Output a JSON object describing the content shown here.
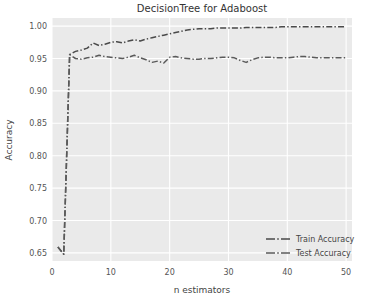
{
  "chart_data": {
    "type": "line",
    "title": "DecisionTree for Adaboost",
    "xlabel": "n estimators",
    "ylabel": "Accuracy",
    "xlim": [
      0,
      51
    ],
    "ylim": [
      0.6375,
      1.0125
    ],
    "xticks": [
      0,
      10,
      20,
      30,
      40,
      50
    ],
    "xticklabels": [
      "0",
      "10",
      "20",
      "30",
      "40",
      "50"
    ],
    "yticks": [
      0.65,
      0.7,
      0.75,
      0.8,
      0.85,
      0.9,
      0.95,
      1.0
    ],
    "yticklabels": [
      "0.65",
      "0.70",
      "0.75",
      "0.80",
      "0.85",
      "0.90",
      "0.95",
      "1.00"
    ],
    "grid": true,
    "grid_color": "#ffffff",
    "plot_bg": "#eaeaea",
    "figure_bg": "#ffffff",
    "legend_position": "lower right",
    "x": [
      1,
      2,
      3,
      4,
      5,
      6,
      7,
      8,
      9,
      10,
      11,
      12,
      13,
      14,
      15,
      16,
      17,
      18,
      19,
      20,
      21,
      22,
      23,
      24,
      25,
      26,
      27,
      28,
      29,
      30,
      31,
      32,
      33,
      34,
      35,
      36,
      37,
      38,
      39,
      40,
      41,
      42,
      43,
      44,
      45,
      46,
      47,
      48,
      49,
      50
    ],
    "series": [
      {
        "name": "Train Accuracy",
        "color": "#4a4a4a",
        "linestyle": "dashdot",
        "values": [
          0.659,
          0.648,
          0.956,
          0.961,
          0.963,
          0.966,
          0.974,
          0.97,
          0.972,
          0.975,
          0.976,
          0.974,
          0.977,
          0.979,
          0.977,
          0.98,
          0.982,
          0.984,
          0.986,
          0.988,
          0.99,
          0.992,
          0.994,
          0.995,
          0.996,
          0.996,
          0.996,
          0.997,
          0.997,
          0.997,
          0.997,
          0.997,
          0.998,
          0.998,
          0.998,
          0.998,
          0.998,
          0.998,
          0.999,
          0.999,
          0.999,
          0.999,
          0.999,
          0.999,
          0.999,
          0.999,
          0.999,
          0.999,
          0.999,
          0.999
        ]
      },
      {
        "name": "Test Accuracy",
        "color": "#5a5a5a",
        "linestyle": "dashdot",
        "values": [
          0.659,
          0.648,
          0.956,
          0.95,
          0.949,
          0.951,
          0.952,
          0.955,
          0.953,
          0.952,
          0.951,
          0.95,
          0.952,
          0.955,
          0.951,
          0.948,
          0.944,
          0.946,
          0.943,
          0.952,
          0.953,
          0.951,
          0.95,
          0.949,
          0.949,
          0.95,
          0.95,
          0.951,
          0.952,
          0.952,
          0.951,
          0.947,
          0.944,
          0.948,
          0.951,
          0.952,
          0.952,
          0.951,
          0.951,
          0.951,
          0.952,
          0.953,
          0.953,
          0.952,
          0.951,
          0.951,
          0.951,
          0.951,
          0.951,
          0.951
        ]
      }
    ]
  }
}
